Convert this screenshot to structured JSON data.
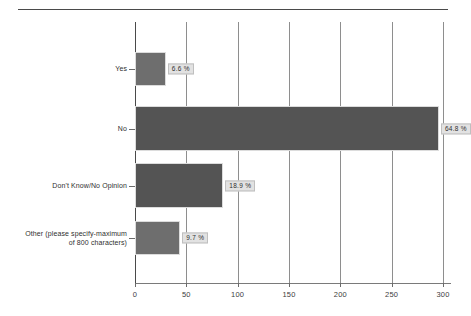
{
  "chart_data": {
    "type": "bar",
    "orientation": "horizontal",
    "title": "",
    "subtitle": "",
    "xlabel": "",
    "ylabel": "",
    "categories": [
      "Yes",
      "No",
      "Don't Know/No Opinion",
      "Other (please specify-maximum\nof 800 characters)"
    ],
    "values": [
      30,
      296,
      86,
      44
    ],
    "data_labels": [
      "6.6 %",
      "64.8 %",
      "18.9 %",
      "9.7 %"
    ],
    "percentages": [
      6.6,
      64.8,
      18.9,
      9.7
    ],
    "xlim": [
      0,
      300
    ],
    "xticks": [
      0,
      50,
      100,
      150,
      200,
      250,
      300
    ],
    "xtick_labels": [
      "0",
      "50",
      "100",
      "150",
      "200",
      "250",
      "300"
    ],
    "grid": true,
    "grid_axis": "x",
    "legend": false,
    "legend_position": "none",
    "colors": {
      "bar_light": "#6e6e6e",
      "bar_dark": "#545454",
      "gridline": "#8e8e8e",
      "axis": "#4a4a4a",
      "label_box_bg": "#e2e2e2",
      "label_box_border": "#bfbfbf",
      "text": "#2f2f2f",
      "background": "#ffffff"
    }
  }
}
